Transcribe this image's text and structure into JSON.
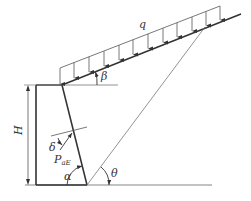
{
  "diagram": {
    "type": "retaining-wall-seismic-earth-pressure",
    "labels": {
      "load": "q",
      "slope_angle": "β",
      "height": "H",
      "friction_angle": "δ",
      "force_main": "P",
      "force_sub": "aE",
      "wall_angle": "α",
      "failure_angle": "θ"
    },
    "colors": {
      "line": "#333333",
      "thin_line": "#777777",
      "background": "#ffffff"
    }
  }
}
